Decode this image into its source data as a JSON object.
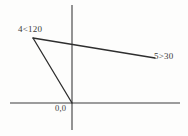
{
  "figure": {
    "type": "vector-phasor-diagram",
    "background_color": "#fdfdfc",
    "axis_color": "#3c3c3c",
    "vector_color": "#2e2e2e",
    "text_color": "#3a3a3a"
  },
  "labels": {
    "vector_1": "4<120",
    "vector_2": "5>30",
    "origin": "0,0"
  },
  "chart_data": {
    "type": "scatter",
    "title": "",
    "xlabel": "",
    "ylabel": "",
    "grid": false,
    "legend": "none",
    "axes": {
      "horizontal": {
        "x1": 10,
        "y1": 103,
        "x2": 180,
        "y2": 103
      },
      "vertical": {
        "x1": 72,
        "y1": 5,
        "x2": 72,
        "y2": 130
      },
      "origin": {
        "x": 72,
        "y": 103
      }
    },
    "annotations": [
      {
        "text": "4<120",
        "x": 18,
        "y": 24,
        "meaning": "4 at angle 120 degrees"
      },
      {
        "text": "5>30",
        "x": 154,
        "y": 51,
        "meaning": "5 at angle 30 degrees"
      },
      {
        "text": "0,0",
        "x": 55,
        "y": 103,
        "meaning": "origin point"
      }
    ],
    "series": [
      {
        "name": "4<120",
        "values": [
          {
            "x": 72,
            "y": 103
          },
          {
            "x": 33,
            "y": 38
          }
        ],
        "magnitude": 4,
        "angle": 120
      },
      {
        "name": "5>30",
        "values": [
          {
            "x": 33,
            "y": 38
          },
          {
            "x": 155,
            "y": 58
          }
        ],
        "magnitude": 5,
        "angle": 30
      }
    ]
  }
}
